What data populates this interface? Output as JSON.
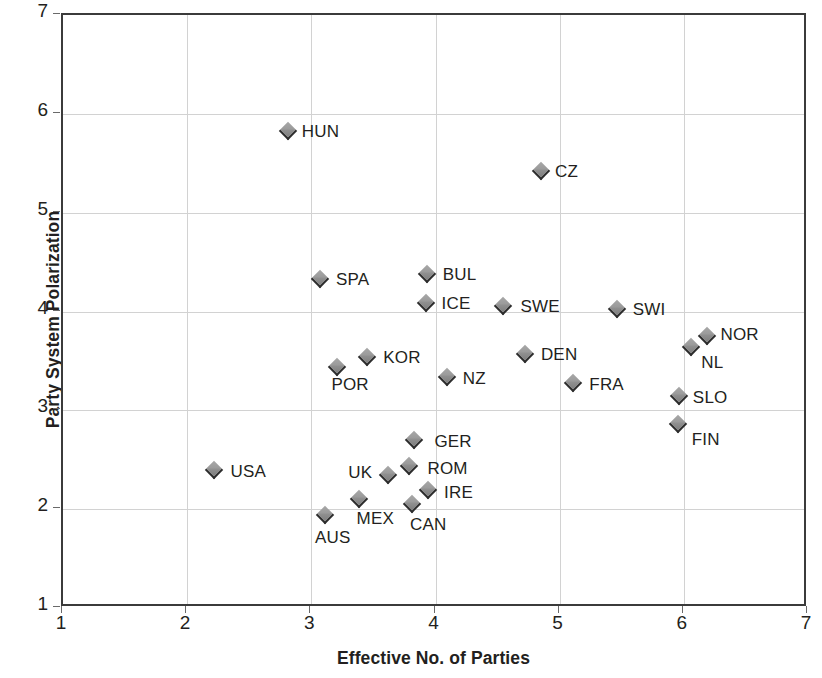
{
  "chart_data": {
    "type": "scatter",
    "title": "",
    "xlabel": "Effective No. of Parties",
    "ylabel": "Party System Polarization",
    "xlim": [
      1,
      7
    ],
    "ylim": [
      1,
      7
    ],
    "xticks": [
      "1",
      "2",
      "3",
      "4",
      "5",
      "6",
      "7"
    ],
    "yticks": [
      "1",
      "2",
      "3",
      "4",
      "5",
      "6",
      "7"
    ],
    "grid": true,
    "legend": "none",
    "marker_style": "diamond",
    "marker_color": "#989898",
    "points": [
      {
        "label": "HUN",
        "x": 2.81,
        "y": 5.83,
        "lx": 14,
        "ly": -9
      },
      {
        "label": "CZ",
        "x": 4.85,
        "y": 5.42,
        "lx": 14,
        "ly": -9
      },
      {
        "label": "SPA",
        "x": 3.07,
        "y": 4.33,
        "lx": 16,
        "ly": -9
      },
      {
        "label": "BUL",
        "x": 3.93,
        "y": 4.38,
        "lx": 16,
        "ly": -9
      },
      {
        "label": "ICE",
        "x": 3.92,
        "y": 4.09,
        "lx": 16,
        "ly": -9
      },
      {
        "label": "SWE",
        "x": 4.54,
        "y": 4.06,
        "lx": 18,
        "ly": -9
      },
      {
        "label": "SWI",
        "x": 5.46,
        "y": 4.03,
        "lx": 16,
        "ly": -9
      },
      {
        "label": "NOR",
        "x": 6.19,
        "y": 3.75,
        "lx": 13,
        "ly": -11
      },
      {
        "label": "NL",
        "x": 6.06,
        "y": 3.64,
        "lx": 10,
        "ly": 6
      },
      {
        "label": "DEN",
        "x": 4.72,
        "y": 3.57,
        "lx": 16,
        "ly": -9
      },
      {
        "label": "KOR",
        "x": 3.45,
        "y": 3.54,
        "lx": 16,
        "ly": -9
      },
      {
        "label": "POR",
        "x": 3.21,
        "y": 3.44,
        "lx": -6,
        "ly": 8
      },
      {
        "label": "NZ",
        "x": 4.09,
        "y": 3.34,
        "lx": 16,
        "ly": -8
      },
      {
        "label": "FRA",
        "x": 5.11,
        "y": 3.28,
        "lx": 16,
        "ly": -8
      },
      {
        "label": "SLO",
        "x": 5.96,
        "y": 3.14,
        "lx": 14,
        "ly": -8
      },
      {
        "label": "FIN",
        "x": 5.95,
        "y": 2.86,
        "lx": 14,
        "ly": 6
      },
      {
        "label": "GER",
        "x": 3.83,
        "y": 2.7,
        "lx": 20,
        "ly": -8
      },
      {
        "label": "USA",
        "x": 2.22,
        "y": 2.4,
        "lx": 16,
        "ly": -8
      },
      {
        "label": "ROM",
        "x": 3.79,
        "y": 2.44,
        "lx": 18,
        "ly": -7
      },
      {
        "label": "UK",
        "x": 3.62,
        "y": 2.35,
        "lx": -40,
        "ly": -12
      },
      {
        "label": "IRE",
        "x": 3.94,
        "y": 2.19,
        "lx": 16,
        "ly": -7
      },
      {
        "label": "MEX",
        "x": 3.38,
        "y": 2.1,
        "lx": -2,
        "ly": 10
      },
      {
        "label": "CAN",
        "x": 3.81,
        "y": 2.05,
        "lx": -2,
        "ly": 11
      },
      {
        "label": "AUS",
        "x": 3.11,
        "y": 1.94,
        "lx": -10,
        "ly": 13
      }
    ]
  }
}
